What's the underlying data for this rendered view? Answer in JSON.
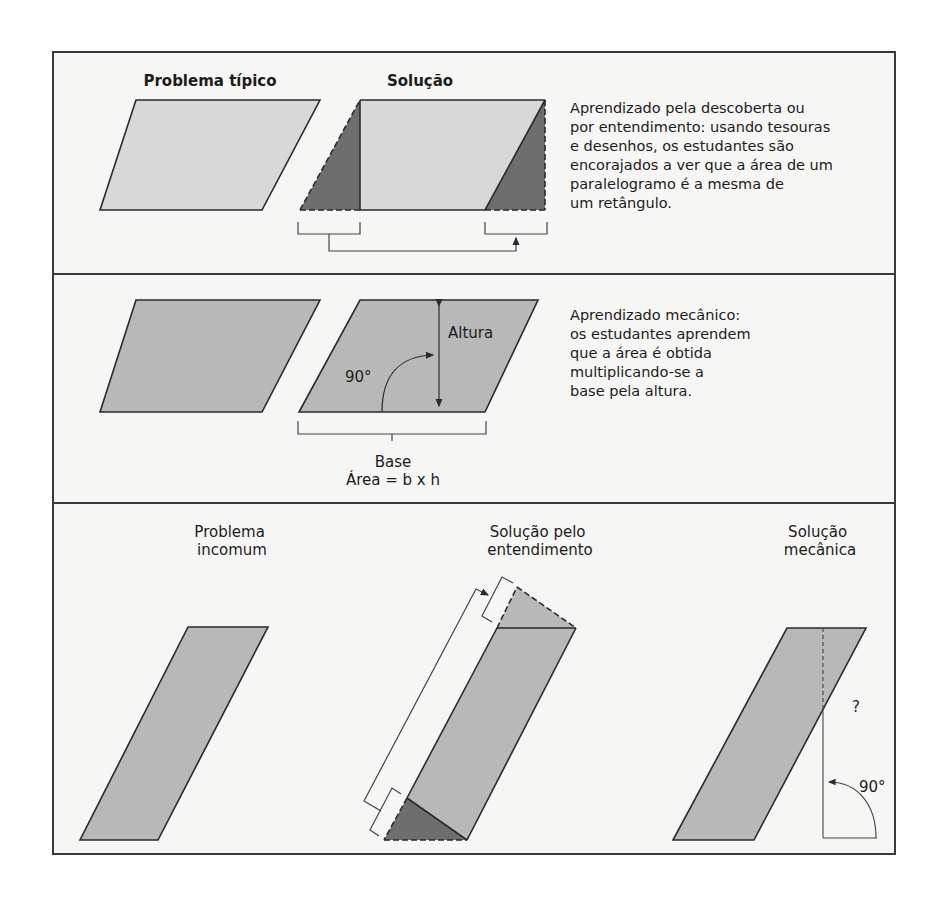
{
  "colors": {
    "frame": "#3a3a3a",
    "light_fill": "#d8d8d8",
    "mid_fill": "#b8b8b8",
    "dark_fill": "#6e6e6e",
    "background": "#f6f6f4"
  },
  "panel_top": {
    "problem_title": "Problema típico",
    "solution_title": "Solução",
    "description": [
      "Aprendizado pela descoberta ou",
      "por entendimento: usando tesouras",
      "e desenhos, os estudantes são",
      "encorajados a ver que a área de um",
      "paralelogramo é a mesma de",
      "um retângulo."
    ]
  },
  "panel_middle": {
    "height_label": "Altura",
    "angle_label": "90°",
    "base_label": "Base",
    "formula": "Área = b x h",
    "description": [
      "Aprendizado mecânico:",
      "os estudantes aprendem",
      "que a área é obtida",
      "multiplicando-se a",
      "base pela altura."
    ]
  },
  "panel_bottom": {
    "problem_title": [
      "Problema",
      "incomum"
    ],
    "understanding_title": [
      "Solução pelo",
      "entendimento"
    ],
    "mechanical_title": [
      "Solução",
      "mecânica"
    ],
    "question_mark": "?",
    "angle_label": "90°"
  }
}
